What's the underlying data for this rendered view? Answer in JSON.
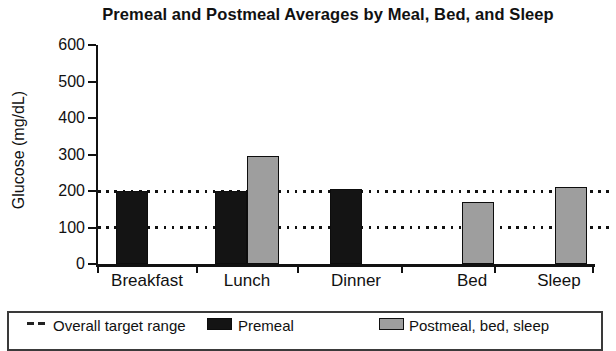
{
  "chart_data": {
    "type": "bar",
    "title": "Premeal and Postmeal Averages by Meal, Bed, and Sleep",
    "ylabel": "Glucose (mg/dL)",
    "xlabel": "",
    "categories": [
      "Breakfast",
      "Lunch",
      "Dinner",
      "Bed",
      "Sleep"
    ],
    "series": [
      {
        "name": "Premeal",
        "color": "#141414",
        "values": [
          200,
          200,
          205,
          null,
          null
        ]
      },
      {
        "name": "Postmeal, bed, sleep",
        "color": "#9e9e9e",
        "values": [
          null,
          295,
          null,
          170,
          210
        ]
      }
    ],
    "target_lines": {
      "label": "Overall target range",
      "values": [
        100,
        200
      ],
      "style": "dotted"
    },
    "ylim": [
      0,
      600
    ],
    "yticks": [
      0,
      100,
      200,
      300,
      400,
      500,
      600
    ],
    "grid": "dotted horizontal target-range lines only",
    "legend_position": "bottom"
  },
  "legend": {
    "items": [
      {
        "label": "Overall target range",
        "marker": "dashed-line-icon"
      },
      {
        "label": "Premeal",
        "marker": "black-square-icon",
        "color": "#141414"
      },
      {
        "label": "Postmeal, bed, sleep",
        "marker": "gray-square-icon",
        "color": "#9e9e9e"
      }
    ]
  }
}
